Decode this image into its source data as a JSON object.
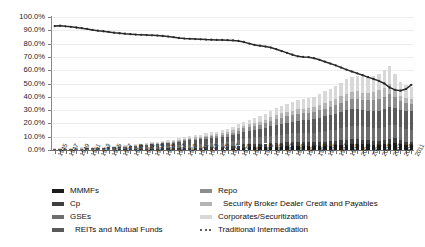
{
  "chart_data": {
    "type": "bar",
    "stacked": true,
    "title": "",
    "subtitle": "",
    "xlabel": "",
    "ylabel": "",
    "ylim": [
      0,
      1.0
    ],
    "ytick_labels": [
      "0.0%",
      "10.0%",
      "20.0%",
      "30.0%",
      "40.0%",
      "50.0%",
      "60.0%",
      "70.0%",
      "80.0%",
      "90.0%",
      "100.0%"
    ],
    "ytick_values": [
      0,
      0.1,
      0.2,
      0.3,
      0.4,
      0.5,
      0.6,
      0.7,
      0.8,
      0.9,
      1.0
    ],
    "grid": true,
    "legend_position": "bottom",
    "x": [
      1945,
      1946,
      1947,
      1948,
      1949,
      1950,
      1951,
      1952,
      1953,
      1954,
      1955,
      1956,
      1957,
      1958,
      1959,
      1960,
      1961,
      1962,
      1963,
      1964,
      1965,
      1966,
      1967,
      1968,
      1969,
      1970,
      1971,
      1972,
      1973,
      1974,
      1975,
      1976,
      1977,
      1978,
      1979,
      1980,
      1981,
      1982,
      1983,
      1984,
      1985,
      1986,
      1987,
      1988,
      1989,
      1990,
      1991,
      1992,
      1993,
      1994,
      1995,
      1996,
      1997,
      1998,
      1999,
      2000,
      2001,
      2002,
      2003,
      2004,
      2005,
      2006,
      2007,
      2008,
      2009,
      2010,
      2011
    ],
    "xtick_labels": [
      "1945",
      "1947",
      "1949",
      "1951",
      "1953",
      "1955",
      "1957",
      "1959",
      "1961",
      "1963",
      "1965",
      "1967",
      "1969",
      "1971",
      "1973",
      "1975",
      "1977",
      "1979",
      "1981",
      "1983",
      "1985",
      "1987",
      "1989",
      "1991",
      "1993",
      "1995",
      "1997",
      "1999",
      "2001",
      "2003",
      "2005",
      "2007",
      "2009",
      "2011"
    ],
    "series": [
      {
        "name": "MMMFs",
        "color": "#1c1c1c",
        "type": "bar-segment",
        "values": [
          0.0,
          0.0,
          0.0,
          0.0,
          0.0,
          0.0,
          0.0,
          0.0,
          0.0,
          0.0,
          0.0,
          0.0,
          0.0,
          0.0,
          0.0,
          0.0,
          0.0,
          0.0,
          0.0,
          0.0,
          0.0,
          0.0,
          0.0,
          0.0,
          0.0,
          0.0,
          0.0,
          0.0,
          0.0,
          0.002,
          0.003,
          0.003,
          0.003,
          0.006,
          0.011,
          0.018,
          0.022,
          0.023,
          0.021,
          0.022,
          0.024,
          0.026,
          0.026,
          0.027,
          0.029,
          0.031,
          0.031,
          0.03,
          0.029,
          0.029,
          0.031,
          0.033,
          0.035,
          0.038,
          0.04,
          0.042,
          0.046,
          0.045,
          0.042,
          0.04,
          0.04,
          0.042,
          0.048,
          0.053,
          0.046,
          0.04,
          0.037
        ]
      },
      {
        "name": "Cp",
        "color": "#3f3f3f",
        "type": "bar-segment",
        "values": [
          0.002,
          0.002,
          0.002,
          0.002,
          0.003,
          0.003,
          0.003,
          0.003,
          0.004,
          0.004,
          0.005,
          0.005,
          0.006,
          0.006,
          0.007,
          0.008,
          0.008,
          0.009,
          0.01,
          0.011,
          0.012,
          0.013,
          0.014,
          0.016,
          0.018,
          0.018,
          0.017,
          0.017,
          0.019,
          0.02,
          0.018,
          0.018,
          0.019,
          0.021,
          0.023,
          0.024,
          0.025,
          0.025,
          0.025,
          0.027,
          0.028,
          0.029,
          0.03,
          0.031,
          0.032,
          0.032,
          0.03,
          0.029,
          0.029,
          0.03,
          0.032,
          0.033,
          0.035,
          0.037,
          0.039,
          0.041,
          0.038,
          0.034,
          0.031,
          0.03,
          0.031,
          0.034,
          0.038,
          0.034,
          0.026,
          0.022,
          0.021
        ]
      },
      {
        "name": "GSEs",
        "color": "#6e6e6e",
        "type": "bar-segment",
        "values": [
          0.002,
          0.002,
          0.002,
          0.003,
          0.003,
          0.003,
          0.004,
          0.004,
          0.005,
          0.005,
          0.006,
          0.006,
          0.007,
          0.008,
          0.009,
          0.01,
          0.011,
          0.012,
          0.013,
          0.014,
          0.015,
          0.016,
          0.017,
          0.019,
          0.021,
          0.023,
          0.025,
          0.026,
          0.028,
          0.031,
          0.032,
          0.033,
          0.035,
          0.038,
          0.041,
          0.044,
          0.046,
          0.048,
          0.05,
          0.053,
          0.056,
          0.058,
          0.06,
          0.062,
          0.064,
          0.067,
          0.069,
          0.07,
          0.072,
          0.076,
          0.079,
          0.081,
          0.083,
          0.087,
          0.092,
          0.096,
          0.099,
          0.101,
          0.1,
          0.097,
          0.095,
          0.096,
          0.099,
          0.104,
          0.101,
          0.096,
          0.092
        ]
      },
      {
        "name": "REITs and Mutual Funds",
        "color": "#5a5a5a",
        "type": "bar-segment",
        "values": [
          0.004,
          0.004,
          0.005,
          0.005,
          0.006,
          0.006,
          0.007,
          0.008,
          0.008,
          0.009,
          0.01,
          0.011,
          0.012,
          0.013,
          0.014,
          0.016,
          0.017,
          0.019,
          0.02,
          0.022,
          0.024,
          0.025,
          0.027,
          0.03,
          0.032,
          0.033,
          0.035,
          0.037,
          0.038,
          0.036,
          0.038,
          0.041,
          0.043,
          0.045,
          0.047,
          0.05,
          0.052,
          0.055,
          0.06,
          0.064,
          0.07,
          0.076,
          0.08,
          0.083,
          0.086,
          0.09,
          0.095,
          0.1,
          0.105,
          0.108,
          0.112,
          0.116,
          0.12,
          0.124,
          0.127,
          0.128,
          0.124,
          0.119,
          0.122,
          0.126,
          0.13,
          0.136,
          0.142,
          0.128,
          0.13,
          0.136,
          0.14
        ]
      },
      {
        "name": "Repo",
        "color": "#8d8d8d",
        "type": "bar-segment",
        "values": [
          0.0,
          0.0,
          0.0,
          0.0,
          0.0,
          0.0,
          0.0,
          0.0,
          0.0,
          0.0,
          0.0,
          0.0,
          0.0,
          0.0,
          0.0,
          0.001,
          0.001,
          0.001,
          0.002,
          0.002,
          0.003,
          0.003,
          0.004,
          0.005,
          0.006,
          0.007,
          0.008,
          0.009,
          0.011,
          0.013,
          0.014,
          0.016,
          0.018,
          0.021,
          0.024,
          0.026,
          0.029,
          0.031,
          0.034,
          0.037,
          0.041,
          0.045,
          0.048,
          0.05,
          0.052,
          0.053,
          0.052,
          0.051,
          0.052,
          0.055,
          0.058,
          0.061,
          0.065,
          0.069,
          0.073,
          0.076,
          0.078,
          0.079,
          0.082,
          0.086,
          0.09,
          0.094,
          0.097,
          0.082,
          0.062,
          0.058,
          0.056
        ]
      },
      {
        "name": "Security Broker Dealer Credit and Payables",
        "color": "#b4b4b4",
        "type": "bar-segment",
        "values": [
          0.001,
          0.001,
          0.001,
          0.001,
          0.001,
          0.001,
          0.001,
          0.002,
          0.002,
          0.002,
          0.002,
          0.002,
          0.003,
          0.003,
          0.003,
          0.004,
          0.004,
          0.004,
          0.005,
          0.005,
          0.006,
          0.006,
          0.007,
          0.008,
          0.008,
          0.009,
          0.01,
          0.011,
          0.012,
          0.012,
          0.013,
          0.014,
          0.015,
          0.016,
          0.018,
          0.019,
          0.021,
          0.022,
          0.024,
          0.026,
          0.028,
          0.03,
          0.032,
          0.033,
          0.034,
          0.035,
          0.035,
          0.036,
          0.038,
          0.04,
          0.042,
          0.044,
          0.047,
          0.05,
          0.053,
          0.056,
          0.055,
          0.053,
          0.055,
          0.058,
          0.062,
          0.066,
          0.07,
          0.056,
          0.044,
          0.042,
          0.041
        ]
      },
      {
        "name": "Corporates/Securitization",
        "color": "#d8d8d8",
        "type": "bar-segment",
        "values": [
          0.001,
          0.001,
          0.001,
          0.001,
          0.001,
          0.002,
          0.002,
          0.002,
          0.002,
          0.003,
          0.003,
          0.003,
          0.004,
          0.004,
          0.005,
          0.005,
          0.006,
          0.006,
          0.007,
          0.008,
          0.008,
          0.009,
          0.01,
          0.011,
          0.012,
          0.014,
          0.015,
          0.016,
          0.018,
          0.019,
          0.021,
          0.023,
          0.025,
          0.027,
          0.029,
          0.032,
          0.034,
          0.037,
          0.04,
          0.044,
          0.048,
          0.053,
          0.057,
          0.061,
          0.064,
          0.068,
          0.07,
          0.073,
          0.077,
          0.081,
          0.086,
          0.09,
          0.095,
          0.101,
          0.107,
          0.112,
          0.115,
          0.117,
          0.119,
          0.122,
          0.126,
          0.131,
          0.136,
          0.118,
          0.1,
          0.092,
          0.088
        ]
      },
      {
        "name": "Traditional Intermediation",
        "color": "#2b2b2b",
        "type": "line",
        "marker": "dot",
        "values": [
          0.932,
          0.935,
          0.93,
          0.926,
          0.921,
          0.916,
          0.91,
          0.903,
          0.897,
          0.893,
          0.888,
          0.882,
          0.878,
          0.874,
          0.871,
          0.868,
          0.866,
          0.864,
          0.862,
          0.86,
          0.857,
          0.853,
          0.848,
          0.842,
          0.838,
          0.836,
          0.834,
          0.832,
          0.83,
          0.829,
          0.828,
          0.827,
          0.826,
          0.824,
          0.82,
          0.812,
          0.8,
          0.79,
          0.784,
          0.778,
          0.77,
          0.758,
          0.744,
          0.73,
          0.716,
          0.704,
          0.7,
          0.698,
          0.69,
          0.678,
          0.664,
          0.65,
          0.636,
          0.62,
          0.604,
          0.59,
          0.576,
          0.562,
          0.548,
          0.534,
          0.52,
          0.5,
          0.47,
          0.452,
          0.446,
          0.458,
          0.49
        ]
      }
    ]
  },
  "axes": {
    "y_ticks": [
      "100.0%",
      "90.0%",
      "80.0%",
      "70.0%",
      "60.0%",
      "50.0%",
      "40.0%",
      "30.0%",
      "20.0%",
      "10.0%",
      "0.0%"
    ]
  },
  "legend": {
    "left_column": [
      {
        "label": "MMMFs",
        "color": "#1c1c1c",
        "kind": "swatch",
        "indent": false
      },
      {
        "label": "Cp",
        "color": "#3f3f3f",
        "kind": "swatch",
        "indent": false
      },
      {
        "label": "GSEs",
        "color": "#6e6e6e",
        "kind": "swatch",
        "indent": false
      },
      {
        "label": "REITs and Mutual Funds",
        "color": "#5a5a5a",
        "kind": "swatch",
        "indent": true
      }
    ],
    "right_column": [
      {
        "label": "Repo",
        "color": "#8d8d8d",
        "kind": "swatch",
        "indent": false
      },
      {
        "label": "Security Broker Dealer Credit and Payables",
        "color": "#b4b4b4",
        "kind": "swatch",
        "indent": true
      },
      {
        "label": "Corporates/Securitization",
        "color": "#d8d8d8",
        "kind": "swatch",
        "indent": false
      },
      {
        "label": "Traditional Intermediation",
        "color": "#2b2b2b",
        "kind": "line",
        "indent": false
      }
    ]
  }
}
